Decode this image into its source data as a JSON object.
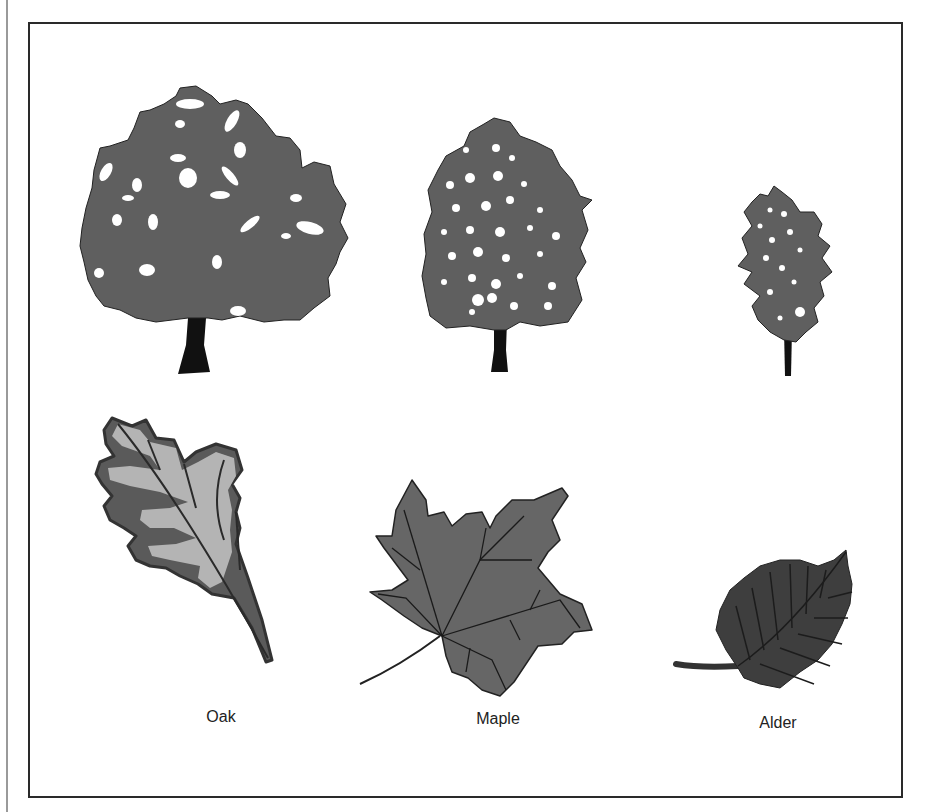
{
  "figure": {
    "colors": {
      "canopy": "#5f5f5f",
      "trunk": "#111111",
      "oak_leaf_light": "#b4b4b4",
      "oak_leaf_dark": "#5a5a5a",
      "maple_leaf": "#666666",
      "alder_leaf": "#3e3e3e",
      "frame": "#2a2a2a"
    },
    "species": [
      {
        "name": "Oak",
        "tree": "broad-rounded-crown",
        "leaf": "lobed-oak-leaf"
      },
      {
        "name": "Maple",
        "tree": "oval-crown",
        "leaf": "palmate-maple-leaf"
      },
      {
        "name": "Alder",
        "tree": "narrow-conical-crown",
        "leaf": "serrated-oval-leaf"
      }
    ]
  }
}
